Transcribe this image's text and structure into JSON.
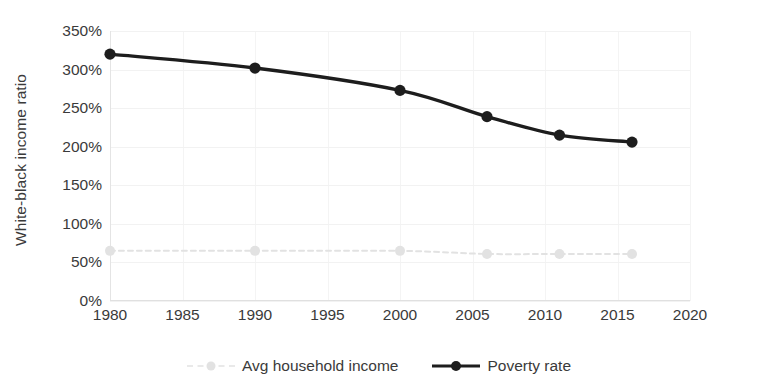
{
  "chart_data": {
    "type": "line",
    "title": "",
    "xlabel": "",
    "ylabel": "White-black income ratio",
    "xlim": [
      1980,
      2020
    ],
    "ylim": [
      0,
      350
    ],
    "xticks": [
      1980,
      1985,
      1990,
      1995,
      2000,
      2005,
      2010,
      2015,
      2020
    ],
    "xtick_labels": [
      "1980",
      "1985",
      "1990",
      "1995",
      "2000",
      "2005",
      "2010",
      "2015",
      "2020"
    ],
    "yticks": [
      0,
      50,
      100,
      150,
      200,
      250,
      300,
      350
    ],
    "ytick_labels": [
      "0%",
      "50%",
      "100%",
      "150%",
      "200%",
      "250%",
      "300%",
      "350%"
    ],
    "grid": true,
    "legend_position": "bottom",
    "series": [
      {
        "name": "Avg household income",
        "color": "#e2e2e2",
        "line_style": "dashed",
        "marker": "circle",
        "x": [
          1980,
          1990,
          2000,
          2006,
          2011,
          2016
        ],
        "values": [
          65,
          65,
          65,
          61,
          61,
          61
        ]
      },
      {
        "name": "Poverty rate",
        "color": "#1d1d1d",
        "line_style": "solid",
        "marker": "circle",
        "x": [
          1980,
          1990,
          2000,
          2006,
          2011,
          2016
        ],
        "values": [
          320,
          302,
          273,
          239,
          215,
          206
        ]
      }
    ]
  },
  "legend": {
    "entries": [
      {
        "label": "Avg household income",
        "icon": "dashed-line-marker-icon"
      },
      {
        "label": "Poverty rate",
        "icon": "solid-line-marker-icon"
      }
    ]
  }
}
